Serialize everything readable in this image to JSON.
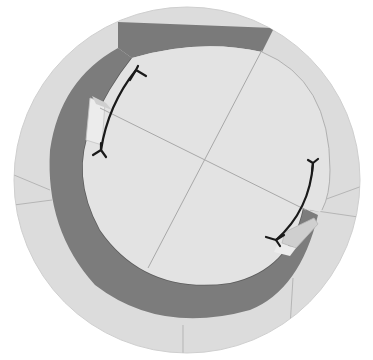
{
  "diagram": {
    "type": "circular-gear-ring-illustration",
    "colors": {
      "background": "#ffffff",
      "outer_disc": "#dcdcdc",
      "inner_disc": "#e3e3e3",
      "crescent_band": "#7c7c7c",
      "crescent_band_dark": "#6a6a6a",
      "facet_light": "#ececec",
      "facet_mid": "#cfcfcf",
      "lines": "#a8a8a8",
      "arrows": "#1a1a1a"
    },
    "arrows": [
      {
        "name": "upper-left-double-headed-arrow",
        "direction": "bidirectional"
      },
      {
        "name": "lower-right-double-headed-arrow",
        "direction": "bidirectional"
      }
    ]
  }
}
